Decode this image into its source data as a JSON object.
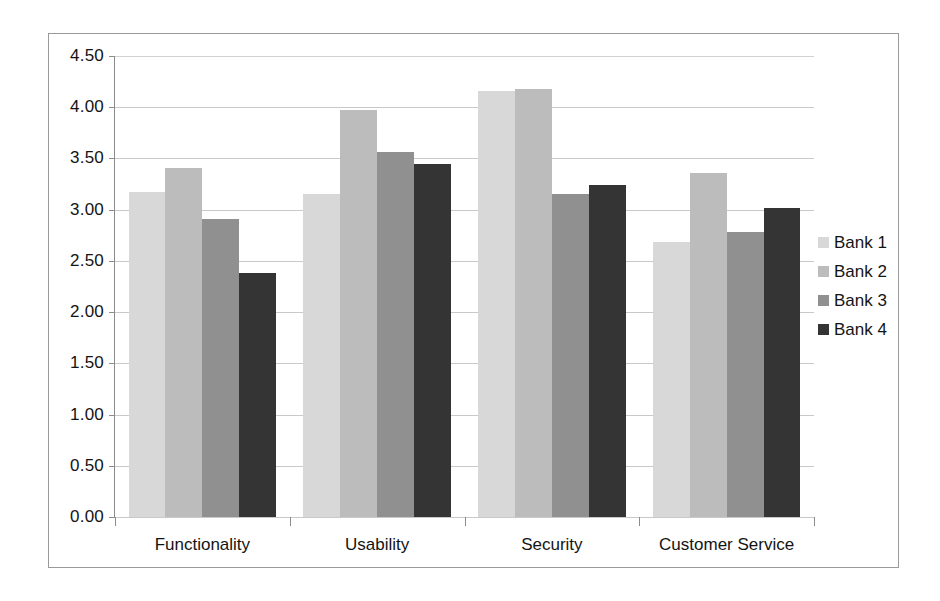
{
  "chart_data": {
    "type": "bar",
    "title": "",
    "xlabel": "",
    "ylabel": "",
    "ylim": [
      0.0,
      4.5
    ],
    "ytick_step": 0.5,
    "grid": true,
    "legend_position": "right",
    "categories": [
      "Functionality",
      "Usability",
      "Security",
      "Customer Service"
    ],
    "ytick_labels": [
      "4.50",
      "4.00",
      "3.50",
      "3.00",
      "2.50",
      "2.00",
      "1.50",
      "1.00",
      "0.50",
      "0.00"
    ],
    "ytick_values": [
      4.5,
      4.0,
      3.5,
      3.0,
      2.5,
      2.0,
      1.5,
      1.0,
      0.5,
      0.0
    ],
    "series": [
      {
        "name": "Bank 1",
        "color": "#d8d8d8",
        "values": [
          3.17,
          3.15,
          4.16,
          2.68
        ]
      },
      {
        "name": "Bank 2",
        "color": "#bcbcbc",
        "values": [
          3.41,
          3.97,
          4.18,
          3.36
        ]
      },
      {
        "name": "Bank 3",
        "color": "#909090",
        "values": [
          2.91,
          3.56,
          3.15,
          2.78
        ]
      },
      {
        "name": "Bank 4",
        "color": "#343434",
        "values": [
          2.38,
          3.45,
          3.24,
          3.02
        ]
      }
    ]
  },
  "legend": {
    "items": [
      {
        "label": "Bank 1"
      },
      {
        "label": "Bank 2"
      },
      {
        "label": "Bank 3"
      },
      {
        "label": "Bank 4"
      }
    ]
  }
}
